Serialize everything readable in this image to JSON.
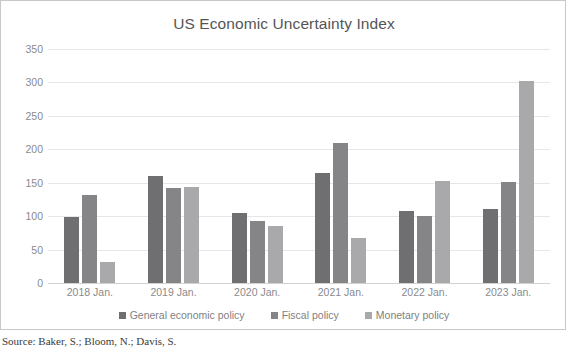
{
  "chart_data": {
    "type": "bar",
    "title": "US Economic Uncertainty Index",
    "xlabel": "",
    "ylabel": "",
    "ylim": [
      0,
      350
    ],
    "ytick_step": 50,
    "yticks": [
      "350",
      "300",
      "250",
      "200",
      "150",
      "100",
      "50",
      "0"
    ],
    "grid": "horizontal",
    "legend_position": "bottom-center",
    "categories": [
      "2018 Jan.",
      "2019 Jan.",
      "2020 Jan.",
      "2021 Jan.",
      "2022 Jan.",
      "2023 Jan."
    ],
    "series": [
      {
        "name": "General economic policy",
        "color": "#6f6f71",
        "values": [
          98,
          160,
          104,
          164,
          108,
          110
        ]
      },
      {
        "name": "Fiscal policy",
        "color": "#858587",
        "values": [
          131,
          142,
          93,
          210,
          100,
          151
        ]
      },
      {
        "name": "Monetary policy",
        "color": "#a9a9ab",
        "values": [
          32,
          144,
          85,
          67,
          152,
          302
        ]
      }
    ]
  },
  "source": {
    "text": "Source: Baker, S.; Bloom, N.; Davis, S."
  }
}
